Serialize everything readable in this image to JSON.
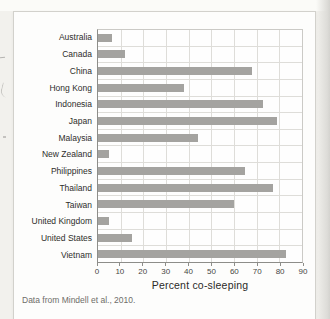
{
  "chart_data": {
    "type": "bar",
    "orientation": "horizontal",
    "title": "",
    "categories": [
      "Australia",
      "Canada",
      "China",
      "Hong Kong",
      "Indonesia",
      "Japan",
      "Malaysia",
      "New Zealand",
      "Philippines",
      "Thailand",
      "Taiwan",
      "United Kingdom",
      "United States",
      "Vietnam"
    ],
    "values": [
      6,
      12,
      68,
      38,
      73,
      79,
      44,
      5,
      65,
      77,
      60,
      5,
      15,
      83
    ],
    "xlabel": "Percent co-sleeping",
    "ylabel": "",
    "xlim": [
      0,
      90
    ],
    "xticks": [
      0,
      10,
      20,
      30,
      40,
      50,
      60,
      70,
      80,
      90
    ],
    "grid": true,
    "legend": "none",
    "bar_color": "#a4a3a0"
  },
  "caption": "Data from Mindell et al., 2010.",
  "colors": {
    "bar": "#a4a3a0",
    "gridline": "#deddd9",
    "axis": "#8d8d89",
    "plot_border": "#cbcac6",
    "panel_bg": "#fdfdfc",
    "page_bg": "#f2f1ed",
    "label_text": "#2e2d2b",
    "tick_text": "#474744",
    "caption_text": "#6e6d69"
  }
}
